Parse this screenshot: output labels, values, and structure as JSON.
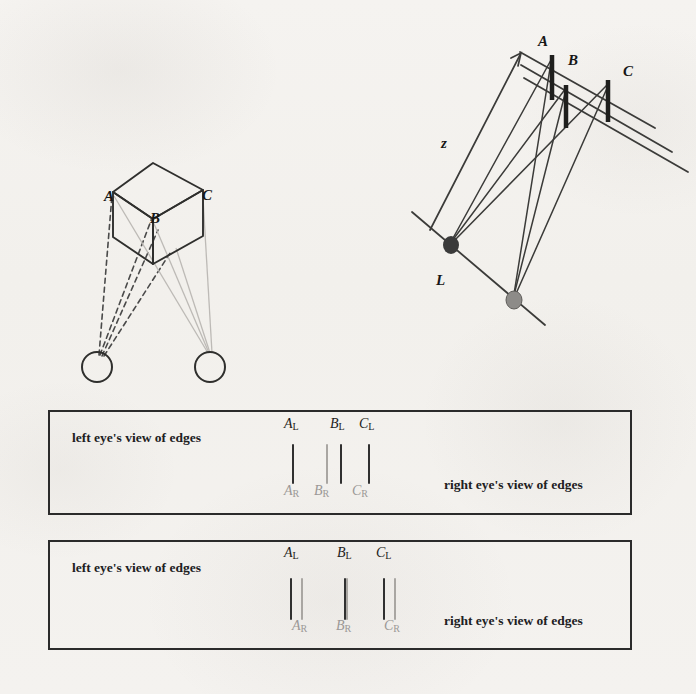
{
  "figure": {
    "caption_left_eye": "left eye's view of edges",
    "caption_right_eye": "right eye's view of edges"
  },
  "cube_diagram": {
    "name": "cube-viewed-by-two-eyes",
    "labels": [
      {
        "id": "A",
        "text": "A",
        "x": 104,
        "y": 197
      },
      {
        "id": "B",
        "text": "B",
        "x": 150,
        "y": 219
      },
      {
        "id": "C",
        "text": "C",
        "x": 202,
        "y": 196
      }
    ],
    "eyes": [
      {
        "id": "left-eye",
        "cx": 97,
        "cy": 367,
        "r": 15
      },
      {
        "id": "right-eye",
        "cx": 210,
        "cy": 367,
        "r": 15
      }
    ]
  },
  "ray_diagram": {
    "name": "edge-projection-ray-diagram",
    "labels": [
      {
        "id": "A",
        "text": "A",
        "x": 538,
        "y": 42
      },
      {
        "id": "B",
        "text": "B",
        "x": 568,
        "y": 61
      },
      {
        "id": "C",
        "text": "C",
        "x": 623,
        "y": 72
      },
      {
        "id": "z",
        "text": "z",
        "x": 441,
        "y": 144
      },
      {
        "id": "L",
        "text": "L",
        "x": 436,
        "y": 281
      }
    ],
    "eye_points": [
      {
        "id": "L-eye-point",
        "cx": 451,
        "cy": 245,
        "rx": 8,
        "ry": 9,
        "fill": "#3a3a3a"
      },
      {
        "id": "second-eye-point",
        "cx": 514,
        "cy": 300,
        "rx": 8,
        "ry": 9,
        "fill": "#8d8b88"
      }
    ],
    "bars": [
      {
        "id": "A",
        "x": 552,
        "y1": 55,
        "y2": 100
      },
      {
        "id": "B",
        "x": 566,
        "y1": 85,
        "y2": 128
      },
      {
        "id": "C",
        "x": 608,
        "y1": 80,
        "y2": 122
      }
    ]
  },
  "panels": [
    {
      "name": "panel-uncrossed-disparity",
      "box": {
        "x": 48,
        "y": 410,
        "w": 584,
        "h": 105
      },
      "left_caption": {
        "text": "left eye's view of edges",
        "x": 72,
        "y": 437
      },
      "right_caption": {
        "text": "right eye's view of edges",
        "x": 444,
        "y": 484
      },
      "top_labels": [
        {
          "letter": "A",
          "sub": "L",
          "x": 284,
          "y": 424
        },
        {
          "letter": "B",
          "sub": "L",
          "x": 330,
          "y": 424
        },
        {
          "letter": "C",
          "sub": "L",
          "x": 359,
          "y": 424
        }
      ],
      "bottom_labels": [
        {
          "letter": "A",
          "sub": "R",
          "x": 284,
          "y": 489
        },
        {
          "letter": "B",
          "sub": "R",
          "x": 314,
          "y": 489
        },
        {
          "letter": "C",
          "sub": "R",
          "x": 352,
          "y": 489
        }
      ],
      "ticks": [
        {
          "id": "A-left",
          "eye": "left",
          "x": 292,
          "y": 444,
          "h": 40
        },
        {
          "id": "B-right",
          "eye": "right",
          "x": 326,
          "y": 444,
          "h": 40
        },
        {
          "id": "B-left",
          "eye": "left",
          "x": 340,
          "y": 444,
          "h": 40
        },
        {
          "id": "C-left",
          "eye": "left",
          "x": 368,
          "y": 444,
          "h": 40
        }
      ]
    },
    {
      "name": "panel-crossed-disparity",
      "box": {
        "x": 48,
        "y": 540,
        "w": 584,
        "h": 110
      },
      "left_caption": {
        "text": "left eye's view of edges",
        "x": 72,
        "y": 567
      },
      "right_caption": {
        "text": "right eye's view of edges",
        "x": 444,
        "y": 620
      },
      "top_labels": [
        {
          "letter": "A",
          "sub": "L",
          "x": 284,
          "y": 553
        },
        {
          "letter": "B",
          "sub": "L",
          "x": 337,
          "y": 553
        },
        {
          "letter": "C",
          "sub": "L",
          "x": 376,
          "y": 553
        }
      ],
      "bottom_labels": [
        {
          "letter": "A",
          "sub": "R",
          "x": 292,
          "y": 625
        },
        {
          "letter": "B",
          "sub": "R",
          "x": 336,
          "y": 625
        },
        {
          "letter": "C",
          "sub": "R",
          "x": 384,
          "y": 625
        }
      ],
      "ticks": [
        {
          "id": "A-left",
          "eye": "left",
          "x": 290,
          "y": 578,
          "h": 42
        },
        {
          "id": "A-right",
          "eye": "right",
          "x": 301,
          "y": 578,
          "h": 42
        },
        {
          "id": "B-left",
          "eye": "left",
          "x": 344,
          "y": 578,
          "h": 42
        },
        {
          "id": "B-right",
          "eye": "right",
          "x": 346,
          "y": 578,
          "h": 42
        },
        {
          "id": "C-left",
          "eye": "left",
          "x": 383,
          "y": 578,
          "h": 42
        },
        {
          "id": "C-right",
          "eye": "right",
          "x": 394,
          "y": 578,
          "h": 42
        }
      ]
    }
  ],
  "colors": {
    "ink": "#2b2b2b",
    "left_eye_ink": "#303030",
    "right_eye_ink": "#a9a6a2",
    "paper": "#f3f1ee"
  }
}
